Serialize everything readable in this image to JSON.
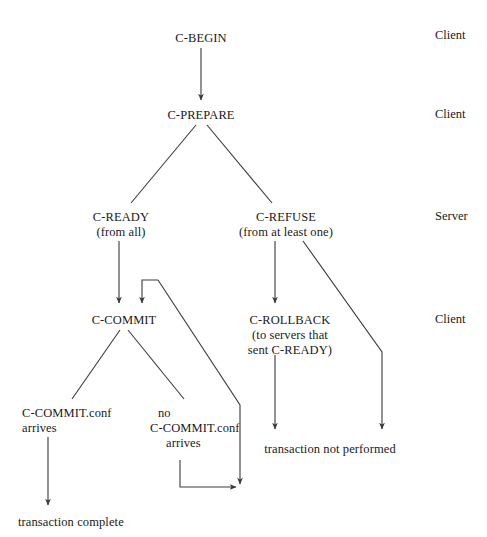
{
  "diagram": {
    "stroke_color": "#3a3a3a",
    "background_color": "#ffffff",
    "nodes": [
      {
        "id": "c-begin",
        "label": "C-BEGIN",
        "x": 201,
        "y": 31,
        "align": "center"
      },
      {
        "id": "c-prepare",
        "label": "C-PREPARE",
        "x": 201,
        "y": 108,
        "align": "center"
      },
      {
        "id": "c-ready",
        "label": "C-READY",
        "x": 121,
        "y": 210,
        "align": "center"
      },
      {
        "id": "c-ready-sub",
        "label": "(from all)",
        "x": 121,
        "y": 225,
        "align": "center"
      },
      {
        "id": "c-refuse",
        "label": "C-REFUSE",
        "x": 286,
        "y": 210,
        "align": "center"
      },
      {
        "id": "c-refuse-sub",
        "label": "(from at least one)",
        "x": 286,
        "y": 225,
        "align": "center"
      },
      {
        "id": "c-commit",
        "label": "C-COMMIT",
        "x": 124,
        "y": 313,
        "align": "center"
      },
      {
        "id": "c-rollback",
        "label": "C-ROLLBACK",
        "x": 290,
        "y": 313,
        "align": "center"
      },
      {
        "id": "c-rollback-s1",
        "label": "(to servers that",
        "x": 290,
        "y": 328,
        "align": "center"
      },
      {
        "id": "c-rollback-s2",
        "label": "sent C-READY)",
        "x": 290,
        "y": 343,
        "align": "center"
      },
      {
        "id": "conf-arrives-1",
        "label": "C-COMMIT.conf",
        "x": 22,
        "y": 406,
        "align": "left"
      },
      {
        "id": "conf-arrives-2",
        "label": "arrives",
        "x": 22,
        "y": 421,
        "align": "left"
      },
      {
        "id": "no-conf-1",
        "label": "no",
        "x": 158,
        "y": 406,
        "align": "left"
      },
      {
        "id": "no-conf-2",
        "label": "C-COMMIT.conf",
        "x": 150,
        "y": 421,
        "align": "left"
      },
      {
        "id": "no-conf-3",
        "label": "arrives",
        "x": 166,
        "y": 436,
        "align": "left"
      },
      {
        "id": "not-performed",
        "label": "transaction not performed",
        "x": 330,
        "y": 442,
        "align": "center"
      },
      {
        "id": "complete",
        "label": "transaction complete",
        "x": 18,
        "y": 515,
        "align": "left"
      }
    ],
    "role_labels": [
      {
        "id": "role-client-1",
        "label": "Client",
        "x": 435,
        "y": 28
      },
      {
        "id": "role-client-2",
        "label": "Client",
        "x": 435,
        "y": 107
      },
      {
        "id": "role-server",
        "label": "Server",
        "x": 435,
        "y": 209
      },
      {
        "id": "role-client-3",
        "label": "Client",
        "x": 435,
        "y": 312
      }
    ],
    "edges": [
      {
        "id": "begin-to-prepare",
        "from": "c-begin",
        "to": "c-prepare",
        "path": "M 201 48 L 201 100",
        "arrow": true
      },
      {
        "id": "prepare-to-ready",
        "from": "c-prepare",
        "to": "c-ready",
        "path": "M 196 125 L 131 203",
        "arrow": false
      },
      {
        "id": "prepare-to-refuse",
        "from": "c-prepare",
        "to": "c-refuse",
        "path": "M 207 125 L 272 203",
        "arrow": false
      },
      {
        "id": "ready-to-commit",
        "from": "c-ready",
        "to": "c-commit",
        "path": "M 119 241 L 119 303",
        "arrow": true
      },
      {
        "id": "loop-back-to-commit",
        "from": "no-conf",
        "to": "c-commit",
        "path": "M 158 280 L 142 280 L 142 303",
        "arrow": true
      },
      {
        "id": "commit-to-timeout-line",
        "from": "c-commit",
        "to": "join-point",
        "path": "M 158 280 L 240 405 L 240 484",
        "arrow": true
      },
      {
        "id": "refuse-to-rollback",
        "from": "c-refuse",
        "to": "c-rollback",
        "path": "M 275 241 L 275 303",
        "arrow": true
      },
      {
        "id": "refuse-to-not-performed",
        "from": "c-refuse",
        "to": "not-performed",
        "path": "M 303 241 L 382 352 L 382 429",
        "arrow": true
      },
      {
        "id": "commit-to-conf",
        "from": "c-commit",
        "to": "conf-arrives",
        "path": "M 120 330 L 72 399",
        "arrow": false
      },
      {
        "id": "commit-to-no-conf",
        "from": "c-commit",
        "to": "no-conf",
        "path": "M 128 330 L 184 399",
        "arrow": false
      },
      {
        "id": "rollback-to-not-perf",
        "from": "c-rollback",
        "to": "not-performed",
        "path": "M 275 355 L 275 429",
        "arrow": true
      },
      {
        "id": "conf-to-complete",
        "from": "conf-arrives",
        "to": "complete",
        "path": "M 48 437 L 48 505",
        "arrow": true
      },
      {
        "id": "no-conf-to-join",
        "from": "no-conf",
        "to": "join-point",
        "path": "M 180 460 L 180 487 L 236 487",
        "arrow": true
      }
    ]
  }
}
